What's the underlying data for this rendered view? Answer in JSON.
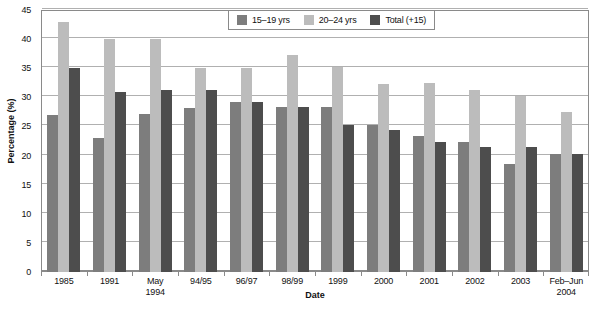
{
  "chart_data": {
    "type": "bar",
    "title": "",
    "xlabel": "Date",
    "ylabel": "Percentage (%)",
    "ylim": [
      0,
      45
    ],
    "yticks": [
      0,
      5,
      10,
      15,
      20,
      25,
      30,
      35,
      40,
      45
    ],
    "grid": true,
    "legend_position": "top-right",
    "categories": [
      "1985",
      "1991",
      "May\n1994",
      "94/95",
      "96/97",
      "98/99",
      "1999",
      "2000",
      "2001",
      "2002",
      "2003",
      "Feb–Jun\n2004"
    ],
    "category_lines": [
      [
        "1985"
      ],
      [
        "1991"
      ],
      [
        "May",
        "1994"
      ],
      [
        "94/95"
      ],
      [
        "96/97"
      ],
      [
        "98/99"
      ],
      [
        "1999"
      ],
      [
        "2000"
      ],
      [
        "2001"
      ],
      [
        "2002"
      ],
      [
        "2003"
      ],
      [
        "Feb–Jun",
        "2004"
      ]
    ],
    "series": [
      {
        "name": "15–19 yrs",
        "color": "#7d7d7d",
        "values": [
          27.0,
          23.0,
          27.2,
          28.2,
          29.2,
          28.3,
          28.3,
          25.2,
          23.3,
          22.4,
          18.5,
          20.3
        ]
      },
      {
        "name": "20–24 yrs",
        "color": "#bcbcbc",
        "values": [
          43.0,
          40.0,
          40.0,
          35.0,
          35.0,
          37.3,
          35.2,
          32.3,
          32.4,
          31.3,
          30.3,
          27.4
        ]
      },
      {
        "name": "Total (+15)",
        "color": "#4d4d4d",
        "values": [
          35.0,
          31.0,
          31.2,
          31.2,
          29.2,
          28.3,
          25.2,
          24.4,
          22.4,
          21.4,
          21.4,
          20.3
        ]
      }
    ]
  },
  "axis": {
    "y_title": "Percentage (%)",
    "x_title": "Date",
    "y_tick_labels": [
      "0",
      "5",
      "10",
      "15",
      "20",
      "25",
      "30",
      "35",
      "40",
      "45"
    ]
  },
  "legend": {
    "entries": [
      {
        "label": "15–19 yrs",
        "swatch": "s0"
      },
      {
        "label": "20–24 yrs",
        "swatch": "s1"
      },
      {
        "label": "Total (+15)",
        "swatch": "s2"
      }
    ]
  }
}
